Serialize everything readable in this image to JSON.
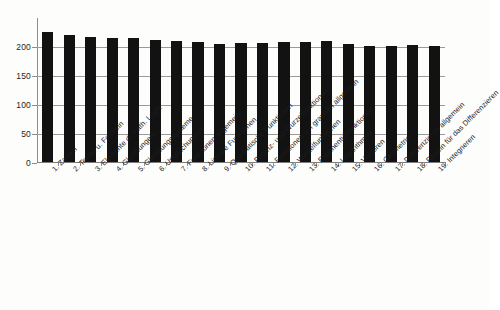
{
  "chart_data": {
    "type": "bar",
    "title": "",
    "subtitle": "",
    "xlabel": "",
    "ylabel": "",
    "ylim": [
      0,
      250
    ],
    "grid": true,
    "legend": false,
    "legend_position": "none",
    "bar_color": "#121212",
    "gridline_color": "#9a9a9a",
    "axis_color": "#8d8d8d",
    "ytick_labels": [
      "0",
      "50",
      "100",
      "150",
      "200"
    ],
    "ytick_values": [
      0,
      50,
      100,
      150,
      200
    ],
    "categories": [
      "1. Zahlen",
      "2. Terme u. Formeln",
      "3. Elemente d. math. Logik",
      "4. Gleichungen",
      "5. Gleichungssysteme",
      "6. Ungleichungen",
      "7. Funktionen allgemein",
      "8. Lineare Funktionen",
      "9. Quadratische Funktionen",
      "10. Potenz- und Wurzelfunktionen",
      "11. Funktionen u. f graphen allgemein",
      "12. Winkelfunktionen",
      "13. Exponentialfunktionen",
      "14. Logarithmus",
      "15. Vektoren",
      "16. Geometrie",
      "17. Differenzieren allgemein",
      "18. Regeln für das Differenzieren",
      "19. Integrieren"
    ],
    "values": [
      225,
      219,
      215,
      214,
      213,
      211,
      208,
      207,
      203,
      206,
      206,
      207,
      207,
      208,
      203,
      200,
      200,
      201,
      200
    ]
  }
}
